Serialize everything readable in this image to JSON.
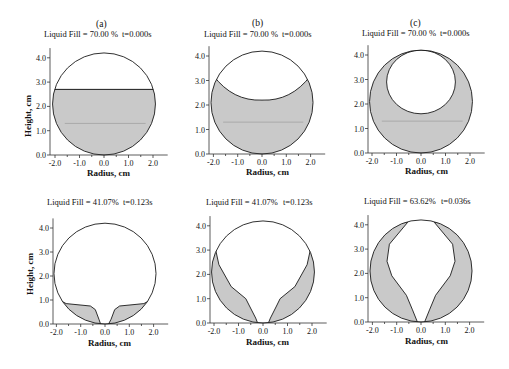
{
  "figure": {
    "colors": {
      "liquid": "#c9c9c9",
      "outline": "#1a1a1a",
      "axis": "#333333",
      "level_line": "#8a8a8a"
    }
  },
  "chart_data": [
    {
      "type": "line",
      "id": "top-a",
      "letter": "(a)",
      "title": "Liquid Fill = 70.00 %",
      "time": "t=0.000s",
      "xlabel": "Radius, cm",
      "ylabel": "Height, cm",
      "xticks": [
        "-2.0",
        "-1.0",
        "0.0",
        "1.0",
        "2.0"
      ],
      "yticks": [
        "0.0",
        "1.0",
        "2.0",
        "3.0",
        "4.0"
      ],
      "xlim": [
        -2.2,
        2.6
      ],
      "ylim": [
        0,
        4.4
      ],
      "shape": "flat-surface",
      "fill_level_cm": 2.7,
      "px": {
        "ox": 104,
        "oy": 155,
        "sx": 24.5,
        "sy": 24.3,
        "axis_x": 50
      }
    },
    {
      "type": "line",
      "id": "top-b",
      "letter": "(b)",
      "title": "Liquid Fill = 70.00 %",
      "time": "t=0.000s",
      "xlabel": "Radius, cm",
      "ylabel": "",
      "xticks": [
        "-2.0",
        "-1.0",
        "0.0",
        "1.0",
        "2.0"
      ],
      "yticks": [
        "0.0",
        "1.0",
        "2.0",
        "3.0",
        "4.0"
      ],
      "xlim": [
        -2.2,
        2.6
      ],
      "ylim": [
        0,
        4.4
      ],
      "shape": "curved-meniscus",
      "meniscus_edge_cm": 3.15,
      "meniscus_bottom_cm": 2.2,
      "px": {
        "ox": 262,
        "oy": 154,
        "sx": 24.3,
        "sy": 24.5,
        "axis_x": 209
      }
    },
    {
      "type": "line",
      "id": "top-c",
      "letter": "(c)",
      "title": "Liquid Fill = 70.00 %",
      "time": "t=0.000s",
      "xlabel": "Radius, cm",
      "ylabel": "",
      "xticks": [
        "-2.0",
        "-1.0",
        "0.0",
        "1.0",
        "2.0"
      ],
      "yticks": [
        "0.0",
        "1.0",
        "2.0",
        "3.0",
        "4.0"
      ],
      "xlim": [
        -2.2,
        2.6
      ],
      "ylim": [
        0,
        4.4
      ],
      "shape": "bubble",
      "bubble_center_cm": [
        0.0,
        2.9
      ],
      "bubble_radius_cm": 1.3,
      "px": {
        "ox": 421,
        "oy": 153,
        "sx": 24.5,
        "sy": 24.5,
        "axis_x": 368
      }
    },
    {
      "type": "line",
      "id": "bottom-a",
      "letter": "",
      "title": "Liquid Fill = 41.07%",
      "time": "t=0.123s",
      "xlabel": "Radius, cm",
      "ylabel": "Height, cm",
      "xticks": [
        "-2.0",
        "-1.0",
        "0.0",
        "1.0",
        "2.0"
      ],
      "yticks": [
        "0.0",
        "1.0",
        "2.0",
        "3.0",
        "4.0"
      ],
      "xlim": [
        -2.2,
        2.6
      ],
      "ylim": [
        0,
        4.4
      ],
      "shape": "low-lobes",
      "px": {
        "ox": 105,
        "oy": 324,
        "sx": 24.3,
        "sy": 24.0,
        "axis_x": 53
      }
    },
    {
      "type": "line",
      "id": "bottom-b",
      "letter": "",
      "title": "Liquid Fill = 41.07%",
      "time": "t=0.123s",
      "xlabel": "Radius, cm",
      "ylabel": "",
      "xticks": [
        "-2.0",
        "-1.0",
        "0.0",
        "1.0",
        "2.0"
      ],
      "yticks": [
        "0.0",
        "1.0",
        "2.0",
        "3.0",
        "4.0"
      ],
      "xlim": [
        -2.2,
        2.6
      ],
      "ylim": [
        0,
        4.4
      ],
      "shape": "thin-walls",
      "px": {
        "ox": 263,
        "oy": 323,
        "sx": 24.5,
        "sy": 24.3,
        "axis_x": 210
      }
    },
    {
      "type": "line",
      "id": "bottom-c",
      "letter": "",
      "title": "Liquid Fill = 63.62%",
      "time": "t=0.036s",
      "xlabel": "Radius, cm",
      "ylabel": "",
      "xticks": [
        "-2.0",
        "-1.0",
        "0.0",
        "1.0",
        "2.0"
      ],
      "yticks": [
        "0.0",
        "1.0",
        "2.0",
        "3.0",
        "4.0"
      ],
      "xlim": [
        -2.2,
        2.6
      ],
      "ylim": [
        0,
        4.4
      ],
      "shape": "thick-walls",
      "px": {
        "ox": 421,
        "oy": 322,
        "sx": 24.3,
        "sy": 24.3,
        "axis_x": 368
      }
    }
  ]
}
